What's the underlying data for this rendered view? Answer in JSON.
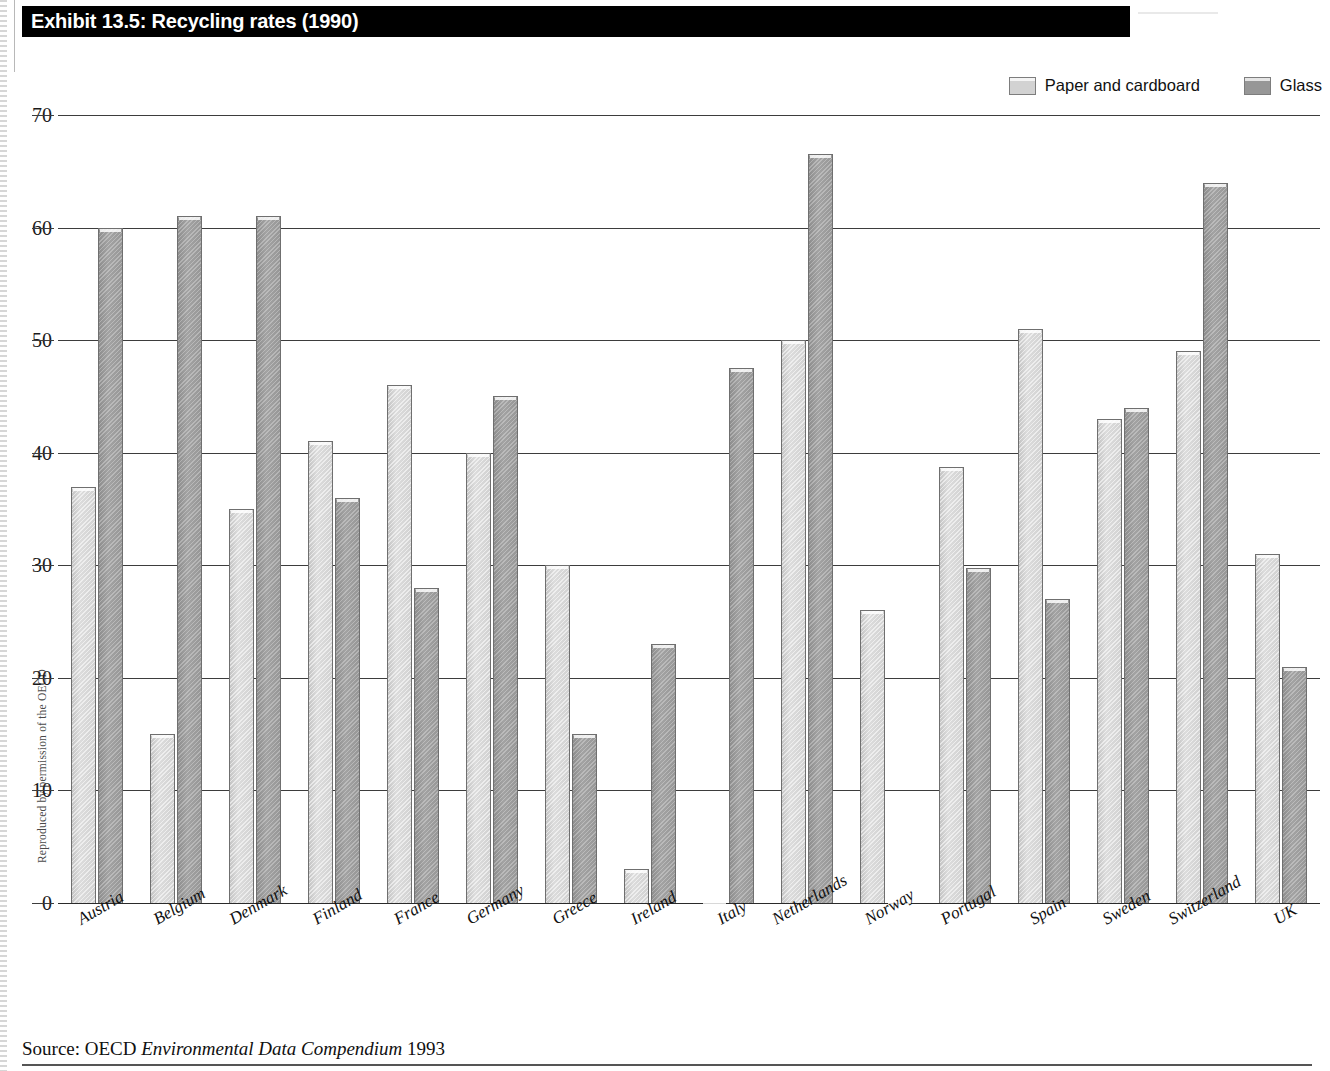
{
  "exhibit": {
    "title": "Exhibit 13.5: Recycling rates (1990)",
    "side_credit": "Reproduced by permission of the OECD",
    "source_prefix": "Source: OECD",
    "source_italic": "Environmental Data Compendium",
    "source_year": "1993"
  },
  "legend": {
    "items": [
      {
        "label": "Paper and cardboard",
        "color": "#d2d2d2",
        "key": "paper"
      },
      {
        "label": "Glass",
        "color": "#979797",
        "key": "glass"
      }
    ]
  },
  "chart_data": {
    "type": "bar",
    "title": "Exhibit 13.5: Recycling rates (1990)",
    "xlabel": "",
    "ylabel": "",
    "ylim": [
      0,
      70
    ],
    "yticks": [
      0,
      10,
      20,
      30,
      40,
      50,
      60,
      70
    ],
    "grid": true,
    "legend_position": "top-right",
    "categories": [
      "Austria",
      "Belgium",
      "Denmark",
      "Finland",
      "France",
      "Germany",
      "Greece",
      "Ireland",
      "Italy",
      "Netherlands",
      "Norway",
      "Portugal",
      "Spain",
      "Sweden",
      "Switzerland",
      "UK"
    ],
    "series": [
      {
        "name": "Paper and cardboard",
        "values": [
          37,
          15,
          35,
          41,
          46,
          40,
          30,
          3,
          null,
          50,
          26,
          38.7,
          51,
          43,
          49,
          31
        ]
      },
      {
        "name": "Glass",
        "values": [
          60,
          61,
          61,
          36,
          28,
          45,
          15,
          23,
          47.5,
          66.5,
          null,
          29.8,
          27,
          44,
          64,
          21
        ]
      }
    ]
  }
}
